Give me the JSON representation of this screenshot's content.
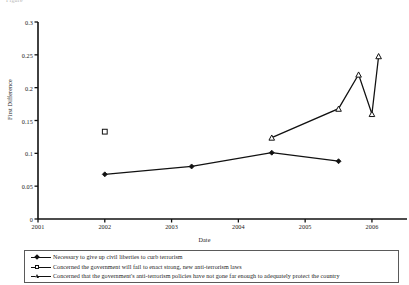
{
  "top_caption": "Figure",
  "chart_data": {
    "type": "line",
    "title": "",
    "xlabel": "Date",
    "ylabel": "First Difference",
    "xlim": [
      2001,
      2006.45
    ],
    "ylim": [
      0,
      0.3
    ],
    "grid": false,
    "legend_position": "bottom",
    "xticks": [
      "2001",
      "2002",
      "2003",
      "2004",
      "2005",
      "2006"
    ],
    "xtick_values": [
      2001,
      2002,
      2003,
      2004,
      2005,
      2006
    ],
    "yticks": [
      "0",
      "0.05",
      "0.1",
      "0.15",
      "0.2",
      "0.25",
      "0.3"
    ],
    "ytick_values": [
      0,
      0.05,
      0.1,
      0.15,
      0.2,
      0.25,
      0.3
    ],
    "series": [
      {
        "name": "Necessary to give up civil liberties to curb terrorism",
        "marker": "filled-diamond",
        "x": [
          2002.0,
          2003.3,
          2004.5,
          2005.5
        ],
        "values": [
          0.068,
          0.08,
          0.101,
          0.088
        ]
      },
      {
        "name": "Concerned the government will fail to enact strong, new anti-terrorism laws",
        "marker": "open-square",
        "x": [
          2002.0
        ],
        "values": [
          0.133
        ]
      },
      {
        "name": "Concerned that the government's anti-terrorism policies have not gone far enough to adequately protect the country",
        "marker": "open-triangle",
        "x": [
          2004.5,
          2005.5,
          2005.8,
          2006.0,
          2006.1
        ],
        "values": [
          0.124,
          0.168,
          0.22,
          0.16,
          0.248
        ]
      }
    ]
  },
  "legend": {
    "items": [
      {
        "marker": "filled-diamond",
        "label": "Necessary to give up civil liberties to curb terrorism"
      },
      {
        "marker": "open-square",
        "label": "Concerned the government will fail to enact strong, new anti-terrorism laws"
      },
      {
        "marker": "open-triangle",
        "label": "Concerned that the government's anti-terrorism policies have not gone far enough to adequately protect the country"
      }
    ]
  }
}
